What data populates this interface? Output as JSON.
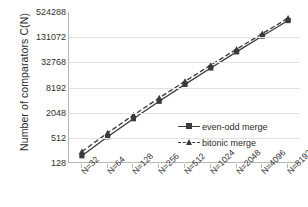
{
  "chart_data": {
    "type": "line",
    "title": "",
    "xlabel": "",
    "ylabel": "Number of comparators C(N)",
    "categories": [
      "N=32",
      "N=64",
      "N=128",
      "N=256",
      "N=512",
      "N=1024",
      "N=2048",
      "N=4096",
      "N=8192"
    ],
    "x_values": [
      32,
      64,
      128,
      256,
      512,
      1024,
      2048,
      4096,
      8192
    ],
    "y_tick_labels": [
      "524288",
      "131072",
      "32768",
      "8192",
      "2048",
      "512",
      "128"
    ],
    "y_tick_values": [
      524288,
      131072,
      32768,
      8192,
      2048,
      512,
      128
    ],
    "y_scale": "log",
    "ylim": [
      128,
      524288
    ],
    "grid": "horizontal",
    "legend_position": "inside-right-lower",
    "series": [
      {
        "name": "even-odd merge",
        "marker": "square",
        "line_style": "solid",
        "color": "#3a3a3a",
        "values": [
          191,
          543,
          1471,
          3839,
          9727,
          24063,
          58367,
          139263,
          327679
        ]
      },
      {
        "name": "bitonic merge",
        "marker": "triangle",
        "line_style": "dashed",
        "color": "#3a3a3a",
        "values": [
          240,
          672,
          1792,
          4608,
          11520,
          28160,
          67584,
          159744,
          372736
        ]
      }
    ]
  },
  "legend": {
    "items": [
      {
        "label": "even-odd merge"
      },
      {
        "label": "bitonic merge"
      }
    ]
  },
  "axes": {
    "y_title": "Number of comparators C(N)"
  },
  "colors": {
    "series": "#3a3a3a",
    "grid": "#e2e2e2",
    "axis": "#b6b6b6",
    "text": "#2f2f2f",
    "background": "#ffffff"
  }
}
